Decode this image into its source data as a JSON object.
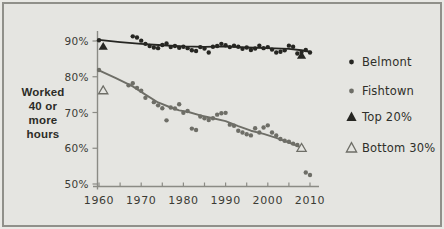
{
  "chart_data": {
    "type": "scatter",
    "title": "",
    "ylabel": "Worked 40 or more hours",
    "ylabel_lines": [
      "Worked",
      "40 or",
      "more",
      "hours"
    ],
    "x_range": [
      1960,
      2010
    ],
    "y_range": [
      50,
      90
    ],
    "grid": false,
    "legend_position": "right",
    "x_ticks": {
      "values": [
        1960,
        1970,
        1980,
        1990,
        2000,
        2010
      ],
      "labels": [
        "1960",
        "1970",
        "1980",
        "1990",
        "2000",
        "2010"
      ]
    },
    "x_minor_tick_step": 5,
    "y_ticks": {
      "values": [
        90,
        80,
        70,
        60,
        50
      ],
      "labels": [
        "90%",
        "80%",
        "70%",
        "60%",
        "50%"
      ]
    },
    "colors": {
      "belmont": "#262622",
      "fishtown": "#6e6e67",
      "axis": "#8b8b85",
      "text": "#3b3b35",
      "background": "#e5e5e1"
    },
    "series": [
      {
        "name": "Belmont",
        "marker": "dot",
        "color_key": "belmont",
        "points": [
          [
            1960,
            90.2
          ],
          [
            1968,
            91.3
          ],
          [
            1969,
            91.0
          ],
          [
            1970,
            90.1
          ],
          [
            1971,
            89.2
          ],
          [
            1972,
            88.6
          ],
          [
            1973,
            88.2
          ],
          [
            1974,
            88.0
          ],
          [
            1975,
            88.9
          ],
          [
            1976,
            89.3
          ],
          [
            1977,
            88.3
          ],
          [
            1978,
            88.6
          ],
          [
            1979,
            88.1
          ],
          [
            1980,
            88.4
          ],
          [
            1981,
            88.0
          ],
          [
            1982,
            87.4
          ],
          [
            1983,
            87.2
          ],
          [
            1984,
            88.3
          ],
          [
            1985,
            87.9
          ],
          [
            1986,
            86.8
          ],
          [
            1987,
            88.4
          ],
          [
            1988,
            88.6
          ],
          [
            1989,
            89.2
          ],
          [
            1990,
            88.8
          ],
          [
            1991,
            88.3
          ],
          [
            1992,
            88.7
          ],
          [
            1993,
            88.4
          ],
          [
            1994,
            87.8
          ],
          [
            1995,
            88.2
          ],
          [
            1996,
            87.5
          ],
          [
            1997,
            87.9
          ],
          [
            1998,
            88.7
          ],
          [
            1999,
            88.0
          ],
          [
            2000,
            88.3
          ],
          [
            2001,
            87.6
          ],
          [
            2002,
            86.8
          ],
          [
            2003,
            87.0
          ],
          [
            2004,
            87.4
          ],
          [
            2005,
            88.7
          ],
          [
            2006,
            88.4
          ],
          [
            2007,
            86.5
          ],
          [
            2008,
            86.9
          ],
          [
            2009,
            87.5
          ],
          [
            2010,
            86.8
          ]
        ],
        "trend": [
          [
            1960,
            90.3
          ],
          [
            1965,
            89.7
          ],
          [
            1970,
            89.2
          ],
          [
            1975,
            88.8
          ],
          [
            1980,
            88.5
          ],
          [
            1985,
            88.35
          ],
          [
            1990,
            88.5
          ],
          [
            1995,
            88.2
          ],
          [
            2000,
            88.0
          ],
          [
            2005,
            87.8
          ],
          [
            2008,
            87.4
          ],
          [
            2010,
            87.0
          ]
        ]
      },
      {
        "name": "Fishtown",
        "marker": "dot",
        "color_key": "fishtown",
        "points": [
          [
            1960,
            81.9
          ],
          [
            1967,
            77.6
          ],
          [
            1968,
            78.2
          ],
          [
            1969,
            76.9
          ],
          [
            1970,
            76.1
          ],
          [
            1971,
            74.1
          ],
          [
            1973,
            72.9
          ],
          [
            1974,
            72.0
          ],
          [
            1975,
            71.2
          ],
          [
            1976,
            67.8
          ],
          [
            1977,
            71.4
          ],
          [
            1978,
            71.1
          ],
          [
            1979,
            72.3
          ],
          [
            1980,
            69.9
          ],
          [
            1981,
            70.4
          ],
          [
            1982,
            65.5
          ],
          [
            1983,
            65.1
          ],
          [
            1984,
            68.9
          ],
          [
            1985,
            68.4
          ],
          [
            1986,
            67.9
          ],
          [
            1987,
            68.4
          ],
          [
            1988,
            69.4
          ],
          [
            1989,
            69.8
          ],
          [
            1990,
            69.9
          ],
          [
            1991,
            66.6
          ],
          [
            1992,
            66.3
          ],
          [
            1993,
            64.9
          ],
          [
            1994,
            64.4
          ],
          [
            1995,
            63.9
          ],
          [
            1996,
            63.6
          ],
          [
            1997,
            65.6
          ],
          [
            1998,
            64.4
          ],
          [
            1999,
            65.8
          ],
          [
            2000,
            66.4
          ],
          [
            2001,
            64.4
          ],
          [
            2002,
            63.6
          ],
          [
            2003,
            62.6
          ],
          [
            2004,
            62.1
          ],
          [
            2005,
            61.8
          ],
          [
            2006,
            61.3
          ],
          [
            2007,
            60.9
          ],
          [
            2008,
            60.3
          ],
          [
            2009,
            53.2
          ],
          [
            2010,
            52.5
          ]
        ],
        "trend": [
          [
            1960,
            81.8
          ],
          [
            1964,
            79.6
          ],
          [
            1968,
            77.3
          ],
          [
            1971,
            75.0
          ],
          [
            1974,
            72.8
          ],
          [
            1977,
            71.4
          ],
          [
            1979,
            70.6
          ],
          [
            1981,
            70.2
          ],
          [
            1984,
            69.2
          ],
          [
            1987,
            68.4
          ],
          [
            1990,
            67.6
          ],
          [
            1993,
            66.2
          ],
          [
            1996,
            64.9
          ],
          [
            1999,
            64.0
          ],
          [
            2002,
            62.9
          ],
          [
            2005,
            61.6
          ],
          [
            2008,
            60.2
          ]
        ]
      },
      {
        "name": "Top 20%",
        "marker": "triangle-filled",
        "color_key": "belmont",
        "points": [
          [
            1961,
            88.5
          ],
          [
            2008,
            86.0
          ]
        ]
      },
      {
        "name": "Bottom 30%",
        "marker": "triangle-open",
        "color_key": "fishtown",
        "points": [
          [
            1961,
            76.2
          ],
          [
            2008,
            60.1
          ]
        ]
      }
    ],
    "legend": [
      {
        "label": "Belmont",
        "marker": "dot",
        "color_key": "belmont"
      },
      {
        "label": "Fishtown",
        "marker": "dot",
        "color_key": "fishtown"
      },
      {
        "label": "Top 20%",
        "marker": "triangle-filled",
        "color_key": "belmont"
      },
      {
        "label": "Bottom 30%",
        "marker": "triangle-open",
        "color_key": "fishtown"
      }
    ]
  }
}
